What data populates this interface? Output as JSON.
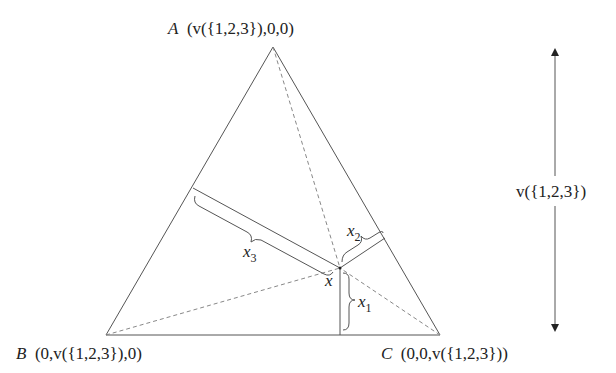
{
  "diagram": {
    "title": "",
    "vertices": {
      "A": {
        "name": "A",
        "coords": "(v({1,2,3}),0,0)"
      },
      "B": {
        "name": "B",
        "coords": "(0,v({1,2,3}),0)"
      },
      "C": {
        "name": "C",
        "coords": "(0,0,v({1,2,3}))"
      }
    },
    "point": {
      "name": "x"
    },
    "distances": [
      {
        "name": "x",
        "sub": "1"
      },
      {
        "name": "x",
        "sub": "2"
      },
      {
        "name": "x",
        "sub": "3"
      }
    ],
    "height_label": "v({1,2,3})",
    "colors": {
      "line": "#555555",
      "dashed": "#888888",
      "text": "#222222"
    }
  }
}
